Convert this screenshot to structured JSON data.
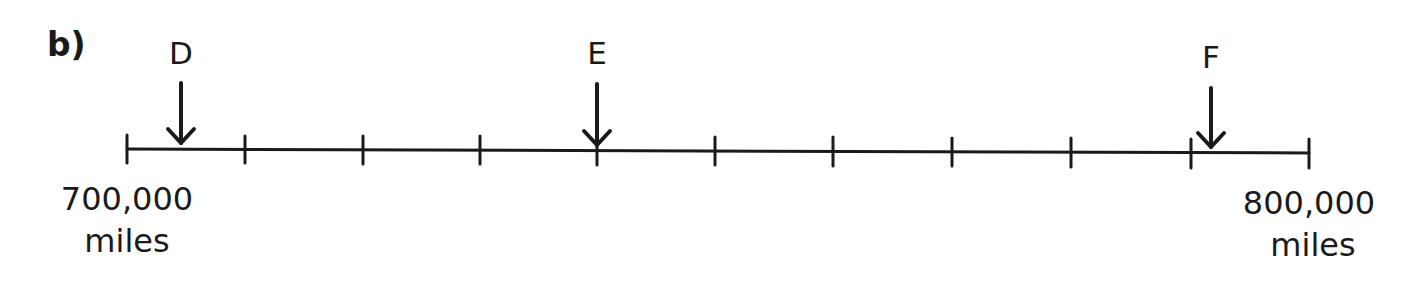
{
  "question": {
    "part_label": "b)"
  },
  "number_line": {
    "start": {
      "value": "700,000",
      "unit": "miles"
    },
    "end": {
      "value": "800,000",
      "unit": "miles"
    },
    "intervals": 10,
    "interval_size": 10000,
    "arrows": [
      {
        "label": "D",
        "position_fraction": 0.045
      },
      {
        "label": "E",
        "position_fraction": 0.4
      },
      {
        "label": "F",
        "position_fraction": 0.92
      }
    ]
  },
  "colors": {
    "ink": "#1a1a1a",
    "background": "#ffffff"
  }
}
